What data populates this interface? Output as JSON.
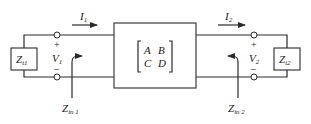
{
  "diagram": {
    "type": "two-port network",
    "network": {
      "matrix": {
        "a": "A",
        "b": "B",
        "c": "C",
        "d": "D"
      }
    },
    "source": {
      "impedance_label": "Z",
      "impedance_sub": "t1"
    },
    "load": {
      "impedance_label": "Z",
      "impedance_sub": "t2"
    },
    "port1": {
      "current_label": "I",
      "current_sub": "1",
      "voltage_label": "V",
      "voltage_sub": "1",
      "plus": "+",
      "minus": "–",
      "input_impedance_label": "Z",
      "input_impedance_sub": "in 1"
    },
    "port2": {
      "current_label": "I",
      "current_sub": "2",
      "voltage_label": "V",
      "voltage_sub": "2",
      "plus": "+",
      "minus": "–",
      "input_impedance_label": "Z",
      "input_impedance_sub": "in 2"
    },
    "colors": {
      "line": "#2a2a2a",
      "background": "#ffffff"
    }
  }
}
